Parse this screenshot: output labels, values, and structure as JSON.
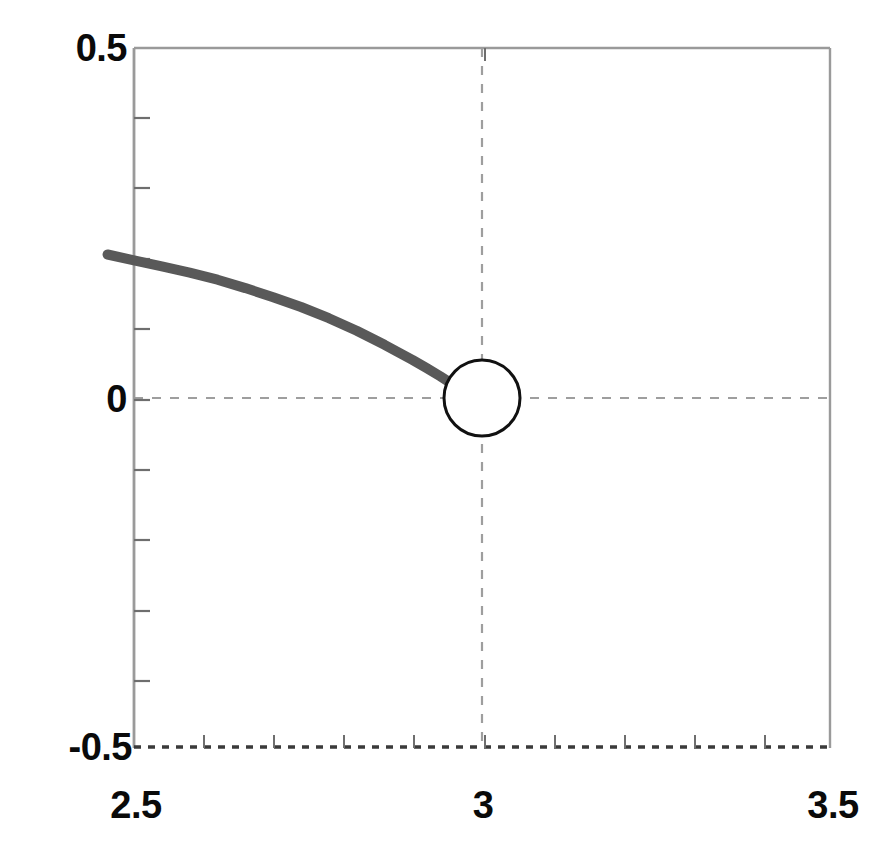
{
  "chart_data": {
    "type": "line",
    "title": "",
    "xlabel": "",
    "ylabel": "",
    "xlim": [
      2.5,
      3.5
    ],
    "ylim": [
      -0.5,
      0.5
    ],
    "grid": true,
    "grid_style": "dashed",
    "gridlines": {
      "x": [
        3
      ],
      "y": [
        0
      ]
    },
    "legend": null,
    "xticks_labeled": [
      "2.5",
      "3",
      "3.5"
    ],
    "xticks_labeled_values": [
      2.5,
      3,
      3.5
    ],
    "yticks_labeled": [
      "0.5",
      "0",
      "-0.5"
    ],
    "yticks_labeled_values": [
      0.5,
      0,
      -0.5
    ],
    "xtick_minor_step": 0.1,
    "ytick_minor_step": 0.1,
    "series": [
      {
        "name": "curve",
        "color": "#595959",
        "linewidth": 10,
        "points": [
          [
            2.462,
            0.205
          ],
          [
            2.5,
            0.1965
          ],
          [
            2.54,
            0.188
          ],
          [
            2.58,
            0.179
          ],
          [
            2.62,
            0.169
          ],
          [
            2.66,
            0.157
          ],
          [
            2.7,
            0.144
          ],
          [
            2.74,
            0.13
          ],
          [
            2.78,
            0.114
          ],
          [
            2.82,
            0.096
          ],
          [
            2.86,
            0.076
          ],
          [
            2.9,
            0.0545
          ],
          [
            2.92,
            0.043
          ],
          [
            2.94,
            0.031
          ],
          [
            2.955,
            0.0215
          ]
        ]
      }
    ],
    "markers": [
      {
        "name": "open-circle-discontinuity",
        "shape": "open-circle",
        "x": 3,
        "y": 0,
        "radius_px": 38,
        "facecolor": "#ffffff",
        "edgecolor": "#111111",
        "edgewidth": 3
      }
    ],
    "frame": {
      "color": "#9a9a9a",
      "bottom_edge_style": "dashed",
      "bottom_edge_color": "#3a3a3a"
    }
  },
  "axes": {
    "y": {
      "top_label": "0.5",
      "mid_label": "0",
      "bottom_label": "-0.5"
    },
    "x": {
      "left_label": "2.5",
      "mid_label": "3",
      "right_label": "3.5"
    }
  },
  "colors": {
    "curve": "#595959",
    "marker_edge": "#111111",
    "grid": "#9e9e9e",
    "frame": "#9a9a9a",
    "label_text": "#0a0a0a",
    "background": "#ffffff"
  }
}
